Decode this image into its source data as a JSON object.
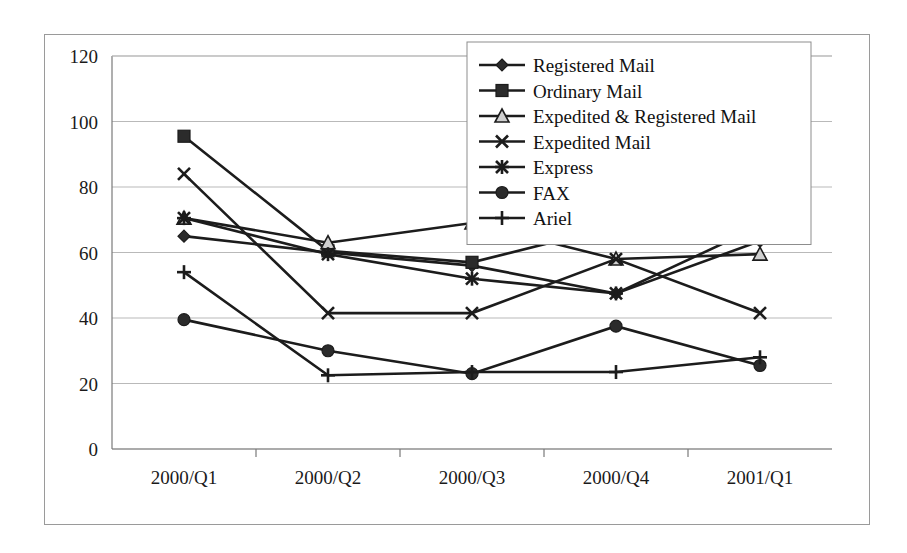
{
  "chart_data": {
    "type": "line",
    "title": "",
    "subtitle": "",
    "xlabel": "",
    "ylabel": "",
    "categories": [
      "2000/Q1",
      "2000/Q2",
      "2000/Q3",
      "2000/Q4",
      "2001/Q1"
    ],
    "ylim": [
      0,
      120
    ],
    "yticks": [
      0,
      20,
      40,
      60,
      80,
      100,
      120
    ],
    "ytick_labels": [
      "0",
      "20",
      "40",
      "60",
      "80",
      "100",
      "120"
    ],
    "grid": true,
    "grid_axis": "y",
    "legend_position": "top-right",
    "series": [
      {
        "name": "Registered Mail",
        "marker": "diamond",
        "color": "#1c1c1c",
        "values": [
          65,
          60,
          56,
          47.5,
          63.5
        ]
      },
      {
        "name": "Ordinary Mail",
        "marker": "square",
        "color": "#1c1c1c",
        "values": [
          95.5,
          60.5,
          57,
          68,
          74
        ]
      },
      {
        "name": "Expedited & Registered Mail",
        "marker": "triangle",
        "color": "#1c1c1c",
        "values": [
          70.5,
          63,
          69,
          58,
          59.5
        ]
      },
      {
        "name": "Expedited Mail",
        "marker": "x",
        "color": "#1c1c1c",
        "values": [
          84,
          41.5,
          41.5,
          58,
          41.5
        ]
      },
      {
        "name": "Express",
        "marker": "star",
        "color": "#1c1c1c",
        "values": [
          70.5,
          59.5,
          52,
          47.5,
          68
        ]
      },
      {
        "name": "FAX",
        "marker": "circle",
        "color": "#1c1c1c",
        "values": [
          39.5,
          30,
          23,
          37.5,
          25.5
        ]
      },
      {
        "name": "Ariel",
        "marker": "plus",
        "color": "#1c1c1c",
        "values": [
          54,
          22.5,
          23.5,
          23.5,
          28
        ]
      }
    ]
  },
  "figure": {
    "background_color": "#ffffff",
    "frame_color": "#9a9a9a",
    "gridline_color": "#b9b9b9",
    "line_color": "#1c1c1c"
  }
}
